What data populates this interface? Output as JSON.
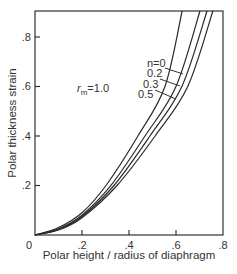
{
  "chart_data": {
    "type": "line",
    "title": "",
    "xlabel": "Polar height / radius of diaphragm",
    "ylabel": "Polar thickness strain",
    "xlim": [
      0,
      0.8
    ],
    "ylim": [
      0,
      0.905
    ],
    "x_ticks": [
      0,
      0.2,
      0.4,
      0.6,
      0.8
    ],
    "x_tick_labels": [
      "0",
      ".2",
      ".4",
      ".6",
      ".8"
    ],
    "y_ticks": [
      0.2,
      0.4,
      0.6,
      0.8
    ],
    "y_tick_labels": [
      ".2",
      ".4",
      ".6",
      ".8"
    ],
    "grid": false,
    "annotations": [
      {
        "text": "r",
        "sub": "m",
        "suffix": "=1.0",
        "x": 0.18,
        "y": 0.63
      }
    ],
    "legend_inline": [
      "n=0",
      "0.2",
      "0.3",
      "0.5"
    ],
    "series": [
      {
        "name": "n=0",
        "x": [
          0,
          0.1,
          0.2,
          0.302,
          0.438,
          0.553,
          0.626
        ],
        "y": [
          0,
          0.03,
          0.09,
          0.2,
          0.4,
          0.6,
          0.905
        ]
      },
      {
        "name": "n=0.2",
        "x": [
          0,
          0.1,
          0.2,
          0.323,
          0.468,
          0.6,
          0.702
        ],
        "y": [
          0,
          0.025,
          0.08,
          0.2,
          0.4,
          0.6,
          0.905
        ]
      },
      {
        "name": "n=0.3",
        "x": [
          0,
          0.1,
          0.2,
          0.336,
          0.489,
          0.625,
          0.732
        ],
        "y": [
          0,
          0.022,
          0.075,
          0.2,
          0.4,
          0.6,
          0.905
        ]
      },
      {
        "name": "n=0.5",
        "x": [
          0,
          0.1,
          0.2,
          0.349,
          0.511,
          0.65,
          0.757
        ],
        "y": [
          0,
          0.02,
          0.07,
          0.2,
          0.4,
          0.6,
          0.905
        ]
      }
    ]
  },
  "labels": {
    "xlabel": "Polar height / radius of diaphragm",
    "ylabel": "Polar thickness strain",
    "rm_r": "r",
    "rm_sub": "m",
    "rm_val": "=1.0",
    "origin": "0",
    "n0": "n=0",
    "n2": "0.2",
    "n3": "0.3",
    "n5": "0.5"
  }
}
